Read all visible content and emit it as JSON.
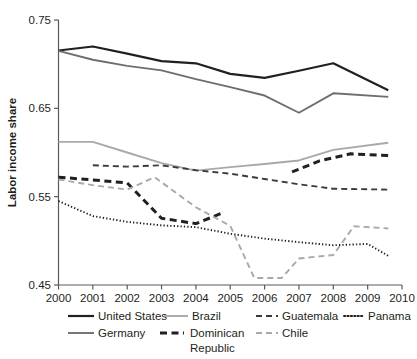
{
  "chart_data": {
    "type": "line",
    "title": "",
    "xlabel": "",
    "ylabel": "Labor income share",
    "xlim": [
      2000,
      2010
    ],
    "ylim": [
      0.45,
      0.75
    ],
    "xticks": [
      "2000",
      "2001",
      "2002",
      "2003",
      "2004",
      "2005",
      "2006",
      "2007",
      "2008",
      "2009",
      "2010"
    ],
    "yticks": [
      "0.75",
      "0.65",
      "0.55",
      "0.45"
    ],
    "grid": false,
    "legend_position": "bottom",
    "series": [
      {
        "name": "United States",
        "style": "solid",
        "color": "#231f20",
        "width": 2.2,
        "x": [
          2000,
          2001,
          2002,
          2003,
          2004,
          2005,
          2006,
          2007,
          2008,
          2009.6
        ],
        "y": [
          0.7155,
          0.72,
          0.712,
          0.7035,
          0.701,
          0.689,
          0.6845,
          0.6925,
          0.701,
          0.6705
        ]
      },
      {
        "name": "Germany",
        "style": "solid",
        "color": "#6d6e71",
        "width": 1.9,
        "x": [
          2000,
          2001,
          2002,
          2003,
          2004,
          2005,
          2006,
          2007,
          2008,
          2009.6
        ],
        "y": [
          0.715,
          0.705,
          0.698,
          0.693,
          0.683,
          0.674,
          0.6645,
          0.645,
          0.667,
          0.663
        ]
      },
      {
        "name": "Brazil",
        "style": "solid",
        "color": "#a7a9ac",
        "width": 1.9,
        "x": [
          2000,
          2001,
          2002,
          2003,
          2004,
          2005,
          2006,
          2007,
          2008,
          2009.6
        ],
        "y": [
          0.612,
          0.612,
          0.6,
          0.588,
          0.5795,
          0.5835,
          0.587,
          0.591,
          0.603,
          0.611
        ]
      },
      {
        "name": "Guatemala",
        "style": "dashed",
        "color": "#3b3b3d",
        "width": 1.9,
        "x": [
          2001,
          2002,
          2003,
          2004,
          2005,
          2006,
          2007,
          2008,
          2009.6
        ],
        "y": [
          0.5855,
          0.584,
          0.5855,
          0.58,
          0.576,
          0.57,
          0.564,
          0.559,
          0.558
        ]
      },
      {
        "name": "Dominican Republic",
        "style": "dashed",
        "color": "#231f20",
        "width": 3.0,
        "segments": [
          {
            "x": [
              2000,
              2001,
              2002,
              2003,
              2004,
              2004.8
            ],
            "y": [
              0.572,
              0.569,
              0.5655,
              0.5255,
              0.5195,
              0.532
            ]
          },
          {
            "x": [
              2006.8,
              2007.6,
              2008.5,
              2009.6
            ],
            "y": [
              0.578,
              0.5905,
              0.5985,
              0.5965
            ]
          }
        ]
      },
      {
        "name": "Chile",
        "style": "dashed",
        "color": "#a7a9ac",
        "width": 1.9,
        "x": [
          2000,
          2001,
          2002,
          2002.8,
          2004,
          2005,
          2005.7,
          2006.5,
          2007,
          2008,
          2008.6,
          2009.6
        ],
        "y": [
          0.5695,
          0.563,
          0.558,
          0.572,
          0.538,
          0.517,
          0.458,
          0.458,
          0.48,
          0.484,
          0.5165,
          0.514
        ]
      },
      {
        "name": "Panama",
        "style": "dotted",
        "color": "#231f20",
        "width": 1.9,
        "x": [
          2000,
          2001,
          2002,
          2003,
          2004,
          2005,
          2006,
          2007,
          2008,
          2009,
          2009.6
        ],
        "y": [
          0.545,
          0.528,
          0.5215,
          0.5175,
          0.5155,
          0.508,
          0.5025,
          0.4985,
          0.495,
          0.4965,
          0.483
        ]
      }
    ]
  },
  "legend": {
    "items": [
      {
        "label": "United States"
      },
      {
        "label": "Brazil"
      },
      {
        "label": "Guatemala"
      },
      {
        "label": "Panama"
      },
      {
        "label": "Germany"
      },
      {
        "label": "Dominican"
      },
      {
        "label": "Republic"
      },
      {
        "label": "Chile"
      }
    ]
  }
}
